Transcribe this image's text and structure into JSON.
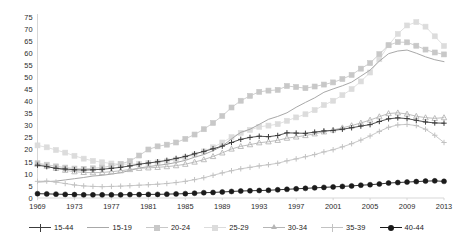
{
  "chart_data": {
    "type": "line",
    "title": "",
    "subtitle": "",
    "xlabel": "",
    "ylabel": "",
    "xlim": [
      1969,
      2013
    ],
    "ylim": [
      0,
      75
    ],
    "ytick_step": 5,
    "xtick_step": 4,
    "grid": false,
    "legend_position": "bottom",
    "x": [
      1969,
      1970,
      1971,
      1972,
      1973,
      1974,
      1975,
      1976,
      1977,
      1978,
      1979,
      1980,
      1981,
      1982,
      1983,
      1984,
      1985,
      1986,
      1987,
      1988,
      1989,
      1990,
      1991,
      1992,
      1993,
      1994,
      1995,
      1996,
      1997,
      1998,
      1999,
      2000,
      2001,
      2002,
      2003,
      2004,
      2005,
      2006,
      2007,
      2008,
      2009,
      2010,
      2011,
      2012,
      2013
    ],
    "xtick_labels": [
      "1969",
      "1973",
      "1977",
      "1981",
      "1985",
      "1989",
      "1993",
      "1997",
      "2001",
      "2005",
      "2009",
      "2013"
    ],
    "ytick_labels": [
      "0",
      "5",
      "10",
      "15",
      "20",
      "25",
      "30",
      "35",
      "40",
      "45",
      "50",
      "55",
      "60",
      "65",
      "70",
      "75"
    ],
    "series": [
      {
        "name": "15-44",
        "marker": "plus",
        "color": "#3c3c3c",
        "values": [
          13.6,
          13.0,
          12.3,
          12.0,
          11.7,
          11.6,
          11.7,
          11.9,
          12.3,
          12.7,
          13.3,
          14.0,
          14.5,
          15.0,
          15.6,
          16.4,
          17.2,
          18.3,
          19.3,
          20.4,
          21.5,
          23.0,
          24.3,
          25.1,
          25.6,
          25.4,
          25.9,
          27.0,
          26.9,
          26.8,
          27.3,
          27.8,
          28.0,
          28.5,
          29.1,
          29.8,
          30.4,
          31.7,
          32.8,
          33.2,
          32.9,
          32.2,
          31.5,
          31.1,
          31.0
        ],
        "final_value": 31.0
      },
      {
        "name": "15-19",
        "marker": "none",
        "color": "#a8a8a8",
        "values": [
          6.6,
          6.8,
          7.0,
          7.5,
          8.0,
          8.5,
          9.1,
          9.4,
          9.9,
          10.5,
          11.4,
          12.4,
          13.0,
          13.5,
          14.0,
          14.7,
          15.6,
          16.9,
          18.0,
          19.6,
          21.5,
          24.5,
          27.2,
          28.5,
          30.5,
          32.6,
          33.8,
          35.3,
          37.6,
          39.6,
          41.5,
          43.8,
          45.2,
          46.5,
          48.0,
          50.5,
          53.0,
          56.7,
          59.8,
          60.9,
          61.3,
          60.0,
          58.5,
          57.3,
          56.5
        ],
        "final_value": 56.5
      },
      {
        "name": "20-24",
        "marker": "square",
        "color": "#c8c8c8",
        "values": [
          14.4,
          13.8,
          13.1,
          12.6,
          12.2,
          12.1,
          12.3,
          12.6,
          13.3,
          14.1,
          15.3,
          17.6,
          20.1,
          21.4,
          22.1,
          23.0,
          24.5,
          26.3,
          28.5,
          31.1,
          34.0,
          37.5,
          40.3,
          42.3,
          44.0,
          44.5,
          44.8,
          46.4,
          46.0,
          45.5,
          46.2,
          47.0,
          47.9,
          49.3,
          51.0,
          53.6,
          55.9,
          59.6,
          63.3,
          64.6,
          64.5,
          63.1,
          61.5,
          60.3,
          59.5
        ],
        "final_value": 59.5
      },
      {
        "name": "25-29",
        "marker": "square-light",
        "color": "#dcdcdc",
        "values": [
          21.8,
          21.0,
          19.9,
          18.8,
          17.5,
          16.3,
          15.4,
          14.8,
          14.3,
          14.0,
          14.0,
          14.2,
          14.5,
          14.8,
          15.2,
          15.9,
          16.8,
          18.0,
          19.3,
          21.0,
          23.0,
          25.2,
          27.0,
          28.2,
          29.5,
          30.0,
          30.6,
          32.0,
          33.4,
          34.7,
          36.4,
          38.5,
          40.3,
          42.6,
          45.1,
          48.3,
          52.0,
          57.5,
          63.3,
          68.0,
          71.5,
          72.9,
          71.0,
          67.0,
          63.0
        ],
        "final_value": 63.0
      },
      {
        "name": "30-34",
        "marker": "triangle",
        "color": "#b5b5b5",
        "values": [
          14.0,
          13.2,
          12.3,
          11.5,
          10.9,
          10.6,
          10.5,
          10.6,
          10.9,
          11.3,
          11.8,
          12.3,
          12.5,
          12.7,
          13.0,
          13.4,
          14.0,
          14.9,
          15.9,
          17.2,
          18.7,
          20.3,
          21.4,
          22.1,
          22.9,
          23.3,
          23.9,
          24.8,
          25.3,
          25.9,
          26.6,
          27.4,
          28.2,
          29.1,
          30.0,
          31.1,
          32.3,
          33.7,
          35.0,
          35.3,
          34.8,
          33.9,
          33.3,
          33.0,
          33.3
        ],
        "final_value": 33.3
      },
      {
        "name": "35-39",
        "marker": "plus-light",
        "color": "#c2c2c2",
        "values": [
          6.9,
          7.0,
          6.6,
          6.0,
          5.4,
          5.0,
          4.8,
          4.7,
          4.8,
          4.9,
          5.1,
          5.3,
          5.5,
          5.7,
          6.0,
          6.4,
          6.9,
          7.6,
          8.4,
          9.4,
          10.4,
          11.3,
          12.1,
          12.7,
          13.3,
          13.8,
          14.4,
          15.4,
          16.2,
          17.1,
          18.0,
          19.1,
          20.0,
          21.2,
          22.5,
          24.0,
          25.7,
          27.6,
          29.3,
          30.3,
          30.5,
          30.0,
          28.5,
          26.0,
          23.0
        ],
        "final_value": 23.0
      },
      {
        "name": "40-44",
        "marker": "circle",
        "color": "#1a1a1a",
        "values": [
          1.8,
          1.7,
          1.6,
          1.5,
          1.4,
          1.3,
          1.3,
          1.3,
          1.3,
          1.3,
          1.4,
          1.4,
          1.5,
          1.5,
          1.6,
          1.7,
          1.8,
          2.0,
          2.2,
          2.3,
          2.5,
          2.7,
          2.9,
          3.0,
          3.1,
          3.2,
          3.4,
          3.6,
          3.8,
          4.0,
          4.2,
          4.4,
          4.6,
          4.8,
          5.0,
          5.3,
          5.5,
          5.8,
          6.2,
          6.4,
          6.6,
          6.8,
          7.0,
          7.1,
          6.9
        ],
        "final_value": 6.9
      }
    ]
  },
  "axes": {
    "y_ticks": [
      "0",
      "5",
      "10",
      "15",
      "20",
      "25",
      "30",
      "35",
      "40",
      "45",
      "50",
      "55",
      "60",
      "65",
      "70",
      "75"
    ],
    "x_ticks": [
      "1969",
      "1973",
      "1977",
      "1981",
      "1985",
      "1989",
      "1993",
      "1997",
      "2001",
      "2005",
      "2009",
      "2013"
    ]
  },
  "legend": {
    "items": [
      {
        "label": "15-44",
        "color": "#3c3c3c",
        "marker": "plus-marker-icon"
      },
      {
        "label": "15-19",
        "color": "#a8a8a8",
        "marker": "line-marker-icon"
      },
      {
        "label": "20-24",
        "color": "#c8c8c8",
        "marker": "square-marker-icon"
      },
      {
        "label": "25-29",
        "color": "#dcdcdc",
        "marker": "square-light-marker-icon"
      },
      {
        "label": "30-34",
        "color": "#b5b5b5",
        "marker": "triangle-marker-icon"
      },
      {
        "label": "35-39",
        "color": "#c2c2c2",
        "marker": "plus-light-marker-icon"
      },
      {
        "label": "40-44",
        "color": "#1a1a1a",
        "marker": "circle-marker-icon"
      }
    ]
  }
}
